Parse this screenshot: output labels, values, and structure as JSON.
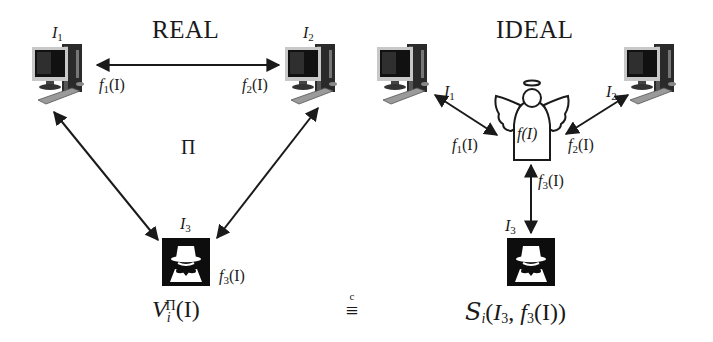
{
  "real": {
    "title": "REAL",
    "protocol_label": "Π",
    "parties": [
      {
        "id": "P1",
        "input_var": "I",
        "input_sub": "1",
        "output_fn": "f",
        "output_sub": "1",
        "output_arg": "(I)"
      },
      {
        "id": "P2",
        "input_var": "I",
        "input_sub": "2",
        "output_fn": "f",
        "output_sub": "2",
        "output_arg": "(I)"
      },
      {
        "id": "P3-adversary",
        "input_var": "I",
        "input_sub": "3",
        "output_fn": "f",
        "output_sub": "3",
        "output_arg": "(I)"
      }
    ],
    "view": {
      "var": "V",
      "sub": "i",
      "sup": "Π",
      "arg": "(I)"
    }
  },
  "equivalence": {
    "symbol": "≡",
    "over": "c"
  },
  "ideal": {
    "title": "IDEAL",
    "trusted_party_label": "f(I)",
    "parties": [
      {
        "id": "P1",
        "input_var": "I",
        "input_sub": "1",
        "output_fn": "f",
        "output_sub": "1",
        "output_arg": "(I)"
      },
      {
        "id": "P2",
        "input_var": "I",
        "input_sub": "2",
        "output_fn": "f",
        "output_sub": "2",
        "output_arg": "(I)"
      },
      {
        "id": "P3-adversary",
        "input_var": "I",
        "input_sub": "3",
        "output_fn": "f",
        "output_sub": "3",
        "output_arg": "(I)"
      }
    ],
    "simulator": {
      "var": "S",
      "sub": "i",
      "arg_open": "(",
      "arg_var": "I",
      "arg_sub": "3",
      "arg_sep": ", ",
      "arg_fn": "f",
      "arg_fn_sub": "3",
      "arg_close": "(I))"
    }
  },
  "icons": {
    "computer": "desktop-computer-icon",
    "adversary": "spy-incognito-icon",
    "trusted_party": "angel-icon"
  },
  "colors": {
    "ink": "#1a1a1a",
    "screen": "#111111",
    "tower": "#2a2a2a",
    "keyboard": "#9a9a9a",
    "background": "#ffffff"
  }
}
